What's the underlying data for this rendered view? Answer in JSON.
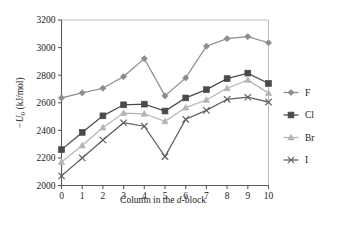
{
  "chart_data": {
    "type": "line",
    "title": "",
    "xlabel": "Column in the d-block",
    "ylabel": "−U0 (kJ/mol)",
    "ylabel_parts": {
      "minus": "−",
      "symbol": "U",
      "subscript": "0",
      "units": "(kJ/mol)"
    },
    "xlabel_parts": {
      "pre": "Column in the ",
      "italic": "d",
      "post": "-block"
    },
    "x": [
      0,
      1,
      2,
      3,
      4,
      5,
      6,
      7,
      8,
      9,
      10
    ],
    "categories": [
      "0",
      "1",
      "2",
      "3",
      "4",
      "5",
      "6",
      "7",
      "8",
      "9",
      "10"
    ],
    "xlim": [
      0,
      10
    ],
    "ylim": [
      2000,
      3200
    ],
    "yticks": [
      2000,
      2200,
      2400,
      2600,
      2800,
      3000,
      3200
    ],
    "ytick_labels": [
      "2000",
      "2200",
      "2400",
      "2600",
      "2800",
      "3000",
      "3200"
    ],
    "xticks": [
      0,
      1,
      2,
      3,
      4,
      5,
      6,
      7,
      8,
      9,
      10
    ],
    "xtick_labels": [
      "0",
      "1",
      "2",
      "3",
      "4",
      "5",
      "6",
      "7",
      "8",
      "9",
      "10"
    ],
    "grid": false,
    "legend_position": "right",
    "series": [
      {
        "name": "F",
        "marker": "diamond",
        "color": "#8c8c8c",
        "values": [
          2635,
          2672,
          2705,
          2790,
          2920,
          2650,
          2780,
          3010,
          3065,
          3080,
          3035
        ]
      },
      {
        "name": "Cl",
        "marker": "square",
        "color": "#4a4a4a",
        "values": [
          2260,
          2385,
          2505,
          2585,
          2590,
          2540,
          2635,
          2695,
          2775,
          2815,
          2740
        ]
      },
      {
        "name": "Br",
        "marker": "triangle",
        "color": "#b5b5b5",
        "values": [
          2170,
          2290,
          2420,
          2525,
          2520,
          2465,
          2565,
          2620,
          2705,
          2765,
          2670
        ]
      },
      {
        "name": "I",
        "marker": "x",
        "color": "#5e5e5e",
        "values": [
          2070,
          2200,
          2330,
          2455,
          2430,
          2210,
          2480,
          2545,
          2625,
          2640,
          2605
        ]
      }
    ]
  },
  "legend": {
    "items": [
      {
        "label": "F"
      },
      {
        "label": "Cl"
      },
      {
        "label": "Br"
      },
      {
        "label": "I"
      }
    ]
  },
  "colors": {
    "axis": "#5a5a5a",
    "border": "#bdbdbd",
    "text": "#1a1a1a",
    "background": "#ffffff"
  }
}
